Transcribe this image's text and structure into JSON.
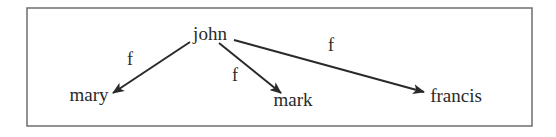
{
  "diagram": {
    "type": "tree",
    "frame": {
      "x": 27,
      "y": 8,
      "width": 505,
      "height": 118,
      "border_color": "#6e6e6e"
    },
    "nodes": [
      {
        "id": "john",
        "label": "john",
        "x": 210,
        "y": 40
      },
      {
        "id": "mary",
        "label": "mary",
        "x": 89,
        "y": 101
      },
      {
        "id": "mark",
        "label": "mark",
        "x": 293,
        "y": 106
      },
      {
        "id": "francis",
        "label": "francis",
        "x": 456,
        "y": 102
      }
    ],
    "edges": [
      {
        "from": "john",
        "to": "mary",
        "label": "f",
        "x1": 190,
        "y1": 42,
        "x2": 113,
        "y2": 93,
        "label_x": 130,
        "label_y": 65
      },
      {
        "from": "john",
        "to": "mark",
        "label": "f",
        "x1": 219,
        "y1": 43,
        "x2": 281,
        "y2": 93,
        "label_x": 235,
        "label_y": 81
      },
      {
        "from": "john",
        "to": "francis",
        "label": "f",
        "x1": 234,
        "y1": 40,
        "x2": 424,
        "y2": 92,
        "label_x": 331,
        "label_y": 51
      }
    ],
    "colors": {
      "ink": "#2a2a2a",
      "background": "#ffffff"
    }
  }
}
